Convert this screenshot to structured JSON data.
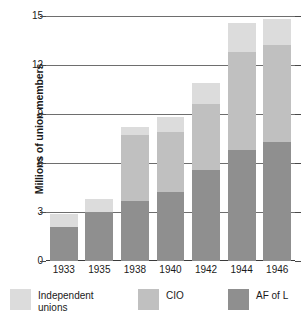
{
  "chart_data": {
    "type": "bar",
    "subtype": "stacked-vertical",
    "title": "",
    "xlabel": "",
    "ylabel": "Millions of union members",
    "categories": [
      "1933",
      "1935",
      "1938",
      "1940",
      "1942",
      "1944",
      "1946"
    ],
    "series": [
      {
        "name": "AF of L",
        "color": "#8f8f8f",
        "values": [
          2.1,
          3.0,
          3.7,
          4.2,
          5.6,
          6.8,
          7.3
        ]
      },
      {
        "name": "CIO",
        "color": "#c0c0c0",
        "values": [
          0.0,
          0.0,
          4.0,
          3.7,
          4.0,
          6.0,
          5.9
        ]
      },
      {
        "name": "Independent\nunions",
        "color": "#dcdcdc",
        "values": [
          0.75,
          0.8,
          0.5,
          0.9,
          1.3,
          1.8,
          1.6
        ]
      }
    ],
    "totals": [
      2.85,
      3.8,
      8.2,
      8.8,
      10.9,
      14.6,
      14.8
    ],
    "ylim": [
      0,
      15
    ],
    "yticks": [
      0,
      3,
      6,
      9,
      12,
      15
    ],
    "ytick_labels": [
      "0",
      "3",
      "6",
      "9",
      "12",
      "15"
    ],
    "grid": true,
    "grid_axis": "y",
    "legend_position": "bottom",
    "legend_order": [
      "Independent\nunions",
      "CIO",
      "AF of L"
    ]
  },
  "legend": {
    "items": [
      {
        "label": "Independent\nunions",
        "color": "#dcdcdc"
      },
      {
        "label": "CIO",
        "color": "#c0c0c0"
      },
      {
        "label": "AF of L",
        "color": "#8f8f8f"
      }
    ]
  },
  "colors": {
    "independent": "#dcdcdc",
    "cio": "#c0c0c0",
    "af_of_l": "#8f8f8f",
    "gridline": "#6e6e6e",
    "axis": "#3a3a3a",
    "text": "#1a1a1a",
    "background": "#ffffff"
  }
}
